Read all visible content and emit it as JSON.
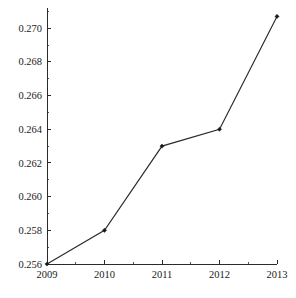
{
  "chart_data": {
    "type": "line",
    "title": "",
    "subtitle": "",
    "xlabel": "",
    "ylabel": "",
    "categories": [
      "2009",
      "2010",
      "2011",
      "2012",
      "2013"
    ],
    "x": [
      2009,
      2010,
      2011,
      2012,
      2013
    ],
    "values": [
      0.256,
      0.258,
      0.263,
      0.264,
      0.2707
    ],
    "series": [
      {
        "name": "series-1",
        "values": [
          0.256,
          0.258,
          0.263,
          0.264,
          0.2707
        ]
      }
    ],
    "xlim": [
      2009,
      2013
    ],
    "ylim": [
      0.256,
      0.2712
    ],
    "ytick_labels": [
      "0.256",
      "0.258",
      "0.260",
      "0.262",
      "0.264",
      "0.266",
      "0.268",
      "0.270"
    ],
    "ytick_values": [
      0.256,
      0.258,
      0.26,
      0.262,
      0.264,
      0.266,
      0.268,
      0.27
    ],
    "ytick_minor_values": [
      0.257,
      0.259,
      0.261,
      0.263,
      0.265,
      0.267,
      0.269,
      0.271
    ],
    "xtick_labels": [
      "2009",
      "2010",
      "2011",
      "2012",
      "2013"
    ],
    "xtick_values": [
      2009,
      2010,
      2011,
      2012,
      2013
    ],
    "xtick_minor_values": [
      2009.5,
      2010.5,
      2011.5,
      2012.5
    ],
    "grid": false,
    "legend": false,
    "legend_position": "none",
    "marker": "diamond",
    "line_color": "#2a2a2a",
    "marker_color": "#1a1a1a",
    "axis_color": "#2b2b2b",
    "background_color": "#ffffff",
    "annotations": []
  },
  "plot_geometry": {
    "left": 47,
    "right": 277,
    "top": 8,
    "bottom": 264
  }
}
